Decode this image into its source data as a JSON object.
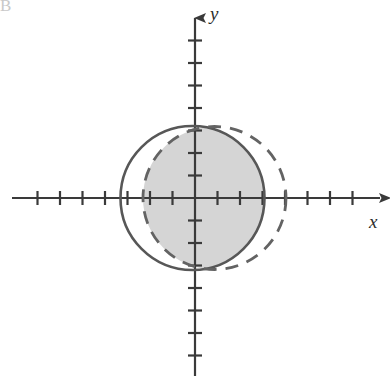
{
  "figure": {
    "corner_label": "B",
    "axes": {
      "x_label": "x",
      "y_label": "y",
      "origin_x": 195,
      "origin_y": 198,
      "tick_spacing": 22.5,
      "x_ticks_left": 7,
      "x_ticks_right": 7,
      "y_ticks_up": 7,
      "y_ticks_down": 7,
      "tick_half_length": 7,
      "axis_color": "#3a3a3a",
      "x_axis_start": 12,
      "x_axis_end": 380,
      "y_axis_start": 18,
      "y_axis_end": 376
    },
    "shapes": [
      {
        "name": "solid-circle",
        "style": "solid",
        "center_x": 192.5,
        "center_y": 198,
        "radius": 72,
        "stroke": "#575757",
        "stroke_width": 2.6,
        "dash": "none"
      },
      {
        "name": "dashed-circle",
        "style": "dashed",
        "center_x": 214.5,
        "center_y": 198,
        "radius": 71.5,
        "stroke": "#636363",
        "stroke_width": 2.8,
        "dash": "13 9"
      }
    ],
    "shaded_region": {
      "name": "intersection-region",
      "description": "intersection of the solid circle and the dashed circle",
      "fill": "#d5d5d5"
    }
  },
  "chart_data": {
    "type": "scatter",
    "title": "",
    "xlabel": "x",
    "ylabel": "y",
    "grid": false,
    "legend": null,
    "axis_units_per_tick": 1,
    "xlim": [
      -8.1,
      8.2
    ],
    "ylim": [
      -8.0,
      8.0
    ],
    "series": [
      {
        "name": "solid circle",
        "type": "circle",
        "linestyle": "solid",
        "center": [
          -0.11,
          0
        ],
        "radius": 3.2
      },
      {
        "name": "dashed circle",
        "type": "circle",
        "linestyle": "dashed",
        "center": [
          0.87,
          0
        ],
        "radius": 3.18
      }
    ],
    "shaded": {
      "label": "intersection of the two circles",
      "fill_color": "#d5d5d5"
    },
    "annotations": []
  }
}
